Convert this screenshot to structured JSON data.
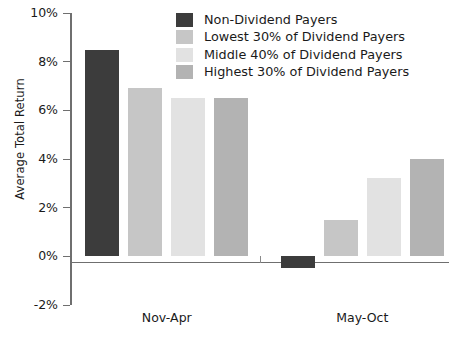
{
  "chart_data": {
    "type": "bar",
    "title": "",
    "xlabel": "",
    "ylabel": "Average Total Return",
    "categories": [
      "Nov-Apr",
      "May-Oct"
    ],
    "series": [
      {
        "name": "Non-Dividend Payers",
        "color": "#3c3c3c",
        "values": [
          8.5,
          -0.5
        ]
      },
      {
        "name": "Lowest 30% of Dividend Payers",
        "color": "#c6c6c6",
        "values": [
          6.9,
          1.5
        ]
      },
      {
        "name": "Middle 40% of Dividend Payers",
        "color": "#e2e2e2",
        "values": [
          6.5,
          3.2
        ]
      },
      {
        "name": "Highest 30% of Dividend Payers",
        "color": "#b3b3b3",
        "values": [
          6.5,
          4.0
        ]
      }
    ],
    "ylim": [
      -2,
      10
    ],
    "yticks": [
      10,
      8,
      6,
      4,
      2,
      0,
      -2
    ],
    "ytick_labels": [
      "10%",
      "8%",
      "6%",
      "4%",
      "2%",
      "0%",
      "-2%"
    ],
    "grid": false,
    "legend_position": "top-center",
    "value_suffix": "%"
  },
  "legend": {
    "items": [
      {
        "label": "Non-Dividend Payers",
        "color": "#3c3c3c"
      },
      {
        "label": "Lowest 30% of Dividend Payers",
        "color": "#c6c6c6"
      },
      {
        "label": "Middle 40% of Dividend Payers",
        "color": "#e2e2e2"
      },
      {
        "label": "Highest 30% of Dividend Payers",
        "color": "#b3b3b3"
      }
    ]
  },
  "axes": {
    "y_title": "Average Total Return",
    "y_tick_labels": [
      "10%",
      "8%",
      "6%",
      "4%",
      "2%",
      "0%",
      "-2%"
    ],
    "x_tick_labels": [
      "Nov-Apr",
      "May-Oct"
    ]
  }
}
